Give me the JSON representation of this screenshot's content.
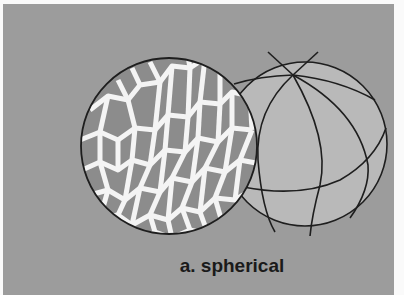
{
  "figure": {
    "caption": "a. spherical",
    "colors": {
      "background": "#9c9c9c",
      "cells": "#8c8c8c",
      "cell_walls": "#f4f4f4",
      "sphere_fill": "#b9b9b9",
      "outline": "#1e1e1e"
    },
    "elements": [
      {
        "name": "cellular-sphere",
        "description": "sphere covered with polygonal cells separated by white walls"
      },
      {
        "name": "wireframe-sphere",
        "description": "sphere with meridian and latitude lines converging at a pole"
      }
    ]
  }
}
